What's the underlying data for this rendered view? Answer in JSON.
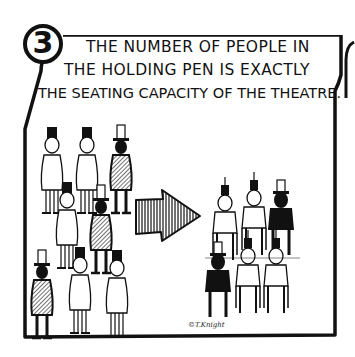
{
  "panel": {
    "number": "3",
    "caption_lines": [
      "THE NUMBER OF PEOPLE IN",
      "THE HOLDING PEN IS EXACTLY",
      "THE SEATING CAPACITY OF THE THEATRE."
    ],
    "signature": "©T.Knight"
  },
  "illustration": {
    "left_group": "standing-people-holding-pen",
    "arrow": "hatched-arrow-right",
    "right_group": "seated-people-theatre"
  },
  "colors": {
    "ink": "#111111",
    "paper": "#ffffff"
  }
}
